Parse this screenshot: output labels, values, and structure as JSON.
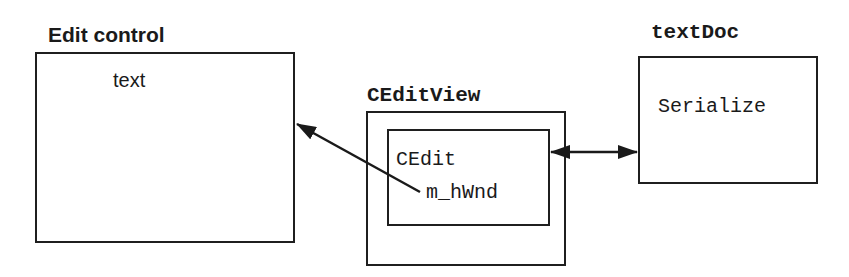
{
  "diagram": {
    "edit_control": {
      "title": "Edit control",
      "content": "text"
    },
    "ceditview": {
      "title": "CEditView",
      "inner": {
        "class_name": "CEdit",
        "member": "m_hWnd"
      }
    },
    "textdoc": {
      "title": "textDoc",
      "content": "Serialize"
    },
    "connections": [
      {
        "from": "m_hWnd",
        "to": "Edit control",
        "type": "single-arrow"
      },
      {
        "from": "CEdit",
        "to": "textDoc",
        "type": "double-arrow"
      }
    ]
  }
}
